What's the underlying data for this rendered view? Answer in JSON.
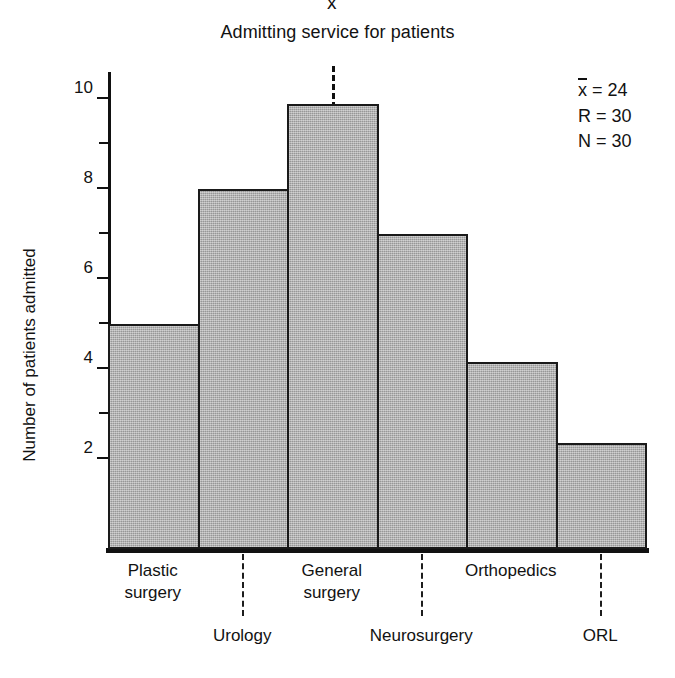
{
  "chart_data": {
    "type": "bar",
    "title": "Admitting service for patients",
    "xlabel": "",
    "ylabel": "Number of patients admitted",
    "categories": [
      "Plastic surgery",
      "Urology",
      "General surgery",
      "Neurosurgery",
      "Orthopedics",
      "ORL"
    ],
    "values": [
      5,
      8,
      9.9,
      7,
      4.15,
      2.35
    ],
    "ylim": [
      0,
      10.6
    ],
    "ytick_labels": [
      "2",
      "4",
      "6",
      "8",
      "10"
    ],
    "ytick_values": [
      2,
      4,
      6,
      8,
      10
    ],
    "yminor_values": [
      3,
      5,
      7,
      9
    ],
    "grid": false,
    "legend": false,
    "bar_fill_color": "#a9a9a9",
    "bar_edge_color": "#1a1a1a",
    "axis_color": "#111111",
    "annotations": {
      "mean_marker_label": "x",
      "mean_marker_category_index": 2
    }
  },
  "title": {
    "text": "Admitting service for patients"
  },
  "axes": {
    "y_title": "Number of patients admitted"
  },
  "category_labels": [
    {
      "line1": "Plastic",
      "line2": "surgery",
      "row": "top"
    },
    {
      "line1": "Urology",
      "line2": "",
      "row": "bot"
    },
    {
      "line1": "General",
      "line2": "surgery",
      "row": "top"
    },
    {
      "line1": "Neurosurgery",
      "line2": "",
      "row": "bot"
    },
    {
      "line1": "Orthopedics",
      "line2": "",
      "row": "top"
    },
    {
      "line1": "ORL",
      "line2": "",
      "row": "bot"
    }
  ],
  "mean_marker": {
    "symbol": "x"
  },
  "stats": {
    "mean_symbol": "x",
    "mean_line": " = 24",
    "range_line": "R = 30",
    "count_line": "N = 30"
  }
}
